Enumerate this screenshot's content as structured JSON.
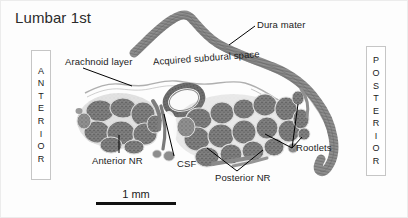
{
  "figure": {
    "title": "Lumbar 1st",
    "modality": "histological-cross-section",
    "specimen": "lumbar first spinal nerve root"
  },
  "annotations": {
    "dura_mater": "Dura mater",
    "arachnoid_layer": "Arachnoid layer",
    "acquired_subdural_space": "Acquired subdural space",
    "anterior_nr": "Anterior NR",
    "csf": "CSF",
    "posterior_nr": "Posterior NR",
    "rootlets": "Rootlets"
  },
  "orientation": {
    "anterior": [
      "A",
      "N",
      "T",
      "E",
      "R",
      "I",
      "O",
      "R"
    ],
    "posterior": [
      "P",
      "O",
      "S",
      "T",
      "E",
      "R",
      "I",
      "O",
      "R"
    ]
  },
  "scalebar": {
    "label": "1 mm",
    "length_px": 80
  },
  "colors": {
    "text": "#1b1b1b",
    "background": "#fdfdfd",
    "box_border": "#c6c6c6",
    "scalebar": "#111111",
    "leader_line": "#000000",
    "tissue_dark": "#6f6f6f",
    "tissue_mid": "#9a9a9a",
    "tissue_light": "#cfcfcf"
  }
}
